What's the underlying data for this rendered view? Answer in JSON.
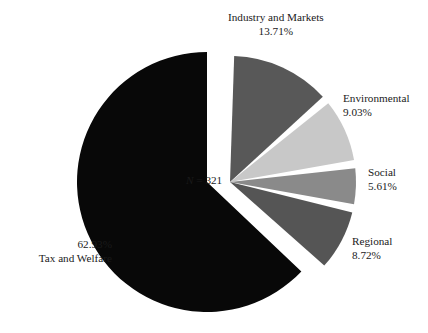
{
  "chart_data": {
    "type": "pie",
    "title": "",
    "subtitle": "",
    "xlabel": "",
    "ylabel": "",
    "legend_position": "none",
    "grid": false,
    "annotation": {
      "symbol": "N",
      "equals": " = ",
      "value": "321",
      "text": "N = 321"
    },
    "categories": [
      "Industry and Markets",
      "Environmental",
      "Social",
      "Regional",
      "Tax and Welfare"
    ],
    "values": [
      13.71,
      9.03,
      5.61,
      8.72,
      62.93
    ],
    "value_labels": [
      "13.71%",
      "9.03%",
      "5.61%",
      "8.72%",
      "62.93%"
    ],
    "colors": [
      "#585858",
      "#c8c8c8",
      "#8a8a8a",
      "#555555",
      "#080808"
    ],
    "exploded": [
      true,
      true,
      true,
      true,
      false
    ],
    "slices": [
      {
        "name": "Industry and Markets",
        "value": 13.71,
        "label": "13.71%",
        "color": "#585858",
        "exploded": true
      },
      {
        "name": "Environmental",
        "value": 9.03,
        "label": "9.03%",
        "color": "#c8c8c8",
        "exploded": true
      },
      {
        "name": "Social",
        "value": 5.61,
        "label": "5.61%",
        "color": "#8a8a8a",
        "exploded": true
      },
      {
        "name": "Regional",
        "value": 8.72,
        "label": "8.72%",
        "color": "#555555",
        "exploded": true
      },
      {
        "name": "Tax and Welfare",
        "value": 62.93,
        "label": "62.93%",
        "color": "#080808",
        "exploded": false
      }
    ]
  },
  "labels": {
    "industry": {
      "name": "Industry and Markets",
      "pct": "13.71%"
    },
    "environmental": {
      "name": "Environmental",
      "pct": "9.03%"
    },
    "social": {
      "name": "Social",
      "pct": "5.61%"
    },
    "regional": {
      "name": "Regional",
      "pct": "8.72%"
    },
    "tax": {
      "name": "Tax and Welfare",
      "pct": "62.93%"
    }
  },
  "annotation": {
    "symbol": "N",
    "equals": " = ",
    "value": "321"
  }
}
